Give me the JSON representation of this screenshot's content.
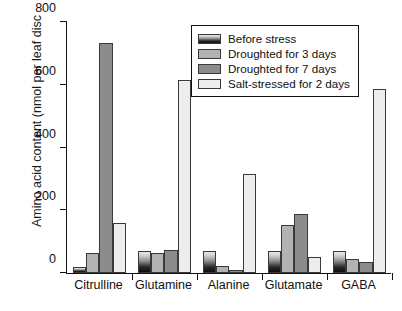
{
  "chart_data": {
    "type": "bar",
    "title": "",
    "xlabel": "",
    "ylabel": "Amino acid content (nmol per leaf disc",
    "ylim": [
      0,
      800
    ],
    "yticks": [
      0,
      200,
      400,
      600,
      800
    ],
    "ytick_labels": [
      "0",
      "200",
      "400",
      "600",
      "800"
    ],
    "grid": false,
    "legend_position": "upper right",
    "categories": [
      "Citrulline",
      "Glutamine",
      "Alanine",
      "Glutamate",
      "GABA"
    ],
    "series": [
      {
        "name": "Before stress",
        "color": "#1a1a1a",
        "values": [
          18,
          70,
          70,
          70,
          70
        ]
      },
      {
        "name": "Droughted for 3 days",
        "color": "#b3b3b3",
        "values": [
          65,
          62,
          22,
          152,
          45
        ]
      },
      {
        "name": "Droughted for 7 days",
        "color": "#8c8c8c",
        "values": [
          730,
          73,
          10,
          187,
          35
        ]
      },
      {
        "name": "Salt-stressed for 2 days",
        "color": "#ededed",
        "values": [
          158,
          612,
          315,
          50,
          585
        ]
      }
    ]
  }
}
